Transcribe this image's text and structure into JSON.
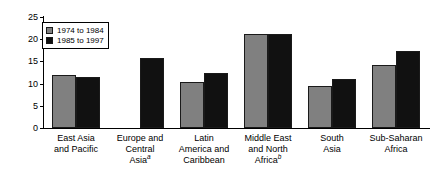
{
  "chart_data": {
    "type": "bar",
    "title": "",
    "xlabel": "",
    "ylabel": "",
    "ylim": [
      0,
      25
    ],
    "yticks": [
      0,
      5,
      10,
      15,
      20,
      25
    ],
    "grid": false,
    "legend_position": "top-left",
    "categories": [
      "East Asia and Pacific",
      "Europe and Central Asia",
      "Latin America and Caribbean",
      "Middle East and North Africa",
      "South Asia",
      "Sub-Saharan Africa"
    ],
    "category_lines": [
      [
        "East Asia",
        "and Pacific"
      ],
      [
        "Europe and",
        "Central",
        "Asia"
      ],
      [
        "Latin",
        "America and",
        "Caribbean"
      ],
      [
        "Middle East",
        "and North",
        "Africa"
      ],
      [
        "South",
        "Asia"
      ],
      [
        "Sub-Saharan",
        "Africa"
      ]
    ],
    "category_footnotes": [
      "",
      "a",
      "",
      "b",
      "",
      ""
    ],
    "series": [
      {
        "name": "1974 to 1984",
        "color": "#808080",
        "values": [
          12.0,
          null,
          10.4,
          21.2,
          9.4,
          14.3
        ]
      },
      {
        "name": "1985 to 1997",
        "color": "#111111",
        "values": [
          11.5,
          15.7,
          12.3,
          21.2,
          11.0,
          17.3
        ]
      }
    ]
  },
  "axis": {
    "tick_labels": [
      "0",
      "5",
      "10",
      "15",
      "20",
      "25"
    ]
  },
  "legend": {
    "entries": [
      {
        "label": "1974 to 1984"
      },
      {
        "label": "1985 to 1997"
      }
    ]
  }
}
